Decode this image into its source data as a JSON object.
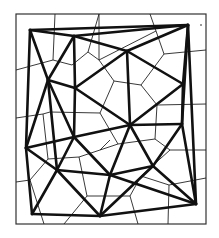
{
  "colors": {
    "background": "#ffffff",
    "frame": "#333333",
    "voronoi_edges": "#222222",
    "delaunay_edges": "#111111"
  },
  "frame": {
    "x": 16,
    "y": 14,
    "width": 190,
    "height": 210
  },
  "sites": [
    {
      "id": "A",
      "x": 30,
      "y": 30
    },
    {
      "id": "B",
      "x": 74,
      "y": 36
    },
    {
      "id": "C",
      "x": 188,
      "y": 25
    },
    {
      "id": "D",
      "x": 48,
      "y": 80
    },
    {
      "id": "E",
      "x": 127,
      "y": 51
    },
    {
      "id": "F",
      "x": 75,
      "y": 88
    },
    {
      "id": "G",
      "x": 183,
      "y": 84
    },
    {
      "id": "H",
      "x": 26,
      "y": 148
    },
    {
      "id": "I",
      "x": 130,
      "y": 125
    },
    {
      "id": "J",
      "x": 182,
      "y": 124
    },
    {
      "id": "K",
      "x": 74,
      "y": 137
    },
    {
      "id": "L",
      "x": 57,
      "y": 170
    },
    {
      "id": "M",
      "x": 110,
      "y": 175
    },
    {
      "id": "N",
      "x": 153,
      "y": 166
    },
    {
      "id": "P",
      "x": 32,
      "y": 214
    },
    {
      "id": "Q",
      "x": 100,
      "y": 216
    },
    {
      "id": "R",
      "x": 196,
      "y": 204
    }
  ],
  "delaunay_edges": [
    [
      "A",
      "C"
    ],
    [
      "A",
      "B"
    ],
    [
      "B",
      "C"
    ],
    [
      "B",
      "E"
    ],
    [
      "C",
      "E"
    ],
    [
      "C",
      "G"
    ],
    [
      "C",
      "J"
    ],
    [
      "C",
      "R"
    ],
    [
      "A",
      "D"
    ],
    [
      "A",
      "H"
    ],
    [
      "D",
      "H"
    ],
    [
      "D",
      "F"
    ],
    [
      "B",
      "D"
    ],
    [
      "D",
      "K"
    ],
    [
      "D",
      "L"
    ],
    [
      "B",
      "F"
    ],
    [
      "F",
      "E"
    ],
    [
      "F",
      "I"
    ],
    [
      "E",
      "G"
    ],
    [
      "E",
      "I"
    ],
    [
      "G",
      "I"
    ],
    [
      "G",
      "J"
    ],
    [
      "I",
      "J"
    ],
    [
      "F",
      "K"
    ],
    [
      "H",
      "K"
    ],
    [
      "K",
      "I"
    ],
    [
      "K",
      "L"
    ],
    [
      "H",
      "L"
    ],
    [
      "H",
      "P"
    ],
    [
      "L",
      "P"
    ],
    [
      "L",
      "Q"
    ],
    [
      "L",
      "M"
    ],
    [
      "K",
      "M"
    ],
    [
      "I",
      "M"
    ],
    [
      "I",
      "N"
    ],
    [
      "J",
      "N"
    ],
    [
      "M",
      "N"
    ],
    [
      "M",
      "Q"
    ],
    [
      "N",
      "R"
    ],
    [
      "J",
      "R"
    ],
    [
      "M",
      "R"
    ],
    [
      "Q",
      "R"
    ],
    [
      "P",
      "Q"
    ],
    [
      "N",
      "Q"
    ]
  ],
  "voronoi_edges": [
    [
      55,
      14,
      53,
      60
    ],
    [
      53,
      60,
      72,
      65
    ],
    [
      72,
      65,
      88,
      52
    ],
    [
      88,
      52,
      99,
      14
    ],
    [
      16,
      70,
      53,
      60
    ],
    [
      99,
      14,
      99,
      60
    ],
    [
      99,
      60,
      88,
      52
    ],
    [
      99,
      60,
      114,
      81
    ],
    [
      150,
      14,
      156,
      31
    ],
    [
      156,
      31,
      99,
      60
    ],
    [
      156,
      31,
      164,
      54
    ],
    [
      164,
      54,
      141,
      85
    ],
    [
      141,
      85,
      114,
      81
    ],
    [
      164,
      54,
      206,
      50
    ],
    [
      141,
      85,
      157,
      105
    ],
    [
      157,
      105,
      206,
      104
    ],
    [
      157,
      105,
      155,
      139
    ],
    [
      114,
      81,
      100,
      113
    ],
    [
      100,
      113,
      118,
      144
    ],
    [
      118,
      144,
      155,
      139
    ],
    [
      155,
      139,
      170,
      150
    ],
    [
      170,
      150,
      206,
      150
    ],
    [
      16,
      118,
      43,
      114
    ],
    [
      43,
      114,
      50,
      112
    ],
    [
      50,
      112,
      100,
      113
    ],
    [
      43,
      114,
      48,
      159
    ],
    [
      48,
      159,
      79,
      157
    ],
    [
      79,
      157,
      100,
      150
    ],
    [
      100,
      150,
      118,
      144
    ],
    [
      79,
      157,
      87,
      196
    ],
    [
      16,
      182,
      30,
      180
    ],
    [
      30,
      180,
      48,
      159
    ],
    [
      30,
      180,
      44,
      224
    ],
    [
      87,
      196,
      64,
      224
    ],
    [
      87,
      196,
      130,
      196
    ],
    [
      130,
      196,
      138,
      224
    ],
    [
      130,
      196,
      141,
      176
    ],
    [
      141,
      176,
      170,
      150
    ],
    [
      141,
      176,
      169,
      185
    ],
    [
      169,
      185,
      168,
      224
    ],
    [
      169,
      185,
      206,
      178
    ],
    [
      100,
      150,
      110,
      140
    ]
  ],
  "annotation_dot": {
    "x": 201,
    "y": 25
  }
}
